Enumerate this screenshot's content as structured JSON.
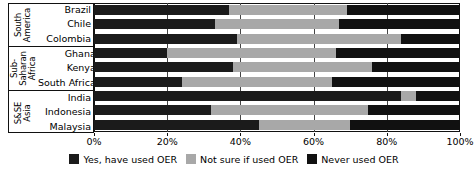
{
  "chart_data": {
    "type": "bar",
    "orientation": "horizontal",
    "stacked": true,
    "normalized_percent": true,
    "title": "",
    "xlabel": "",
    "ylabel": "",
    "xlim": [
      0,
      100
    ],
    "grid": true,
    "legend_position": "bottom",
    "xticks": [
      {
        "value": 0,
        "label": "0%"
      },
      {
        "value": 20,
        "label": "20%"
      },
      {
        "value": 40,
        "label": "40%"
      },
      {
        "value": 60,
        "label": "60%"
      },
      {
        "value": 80,
        "label": "80%"
      },
      {
        "value": 100,
        "label": "100%"
      }
    ],
    "series": [
      {
        "name": "Yes, have used OER",
        "color": "#1b1b1b",
        "key": "yes"
      },
      {
        "name": "Not sure if used OER",
        "color": "#a8a8a8",
        "key": "not_sure"
      },
      {
        "name": "Never used OER",
        "color": "#111111",
        "key": "never"
      }
    ],
    "groups": [
      {
        "name": "South America",
        "title_lines": [
          "South",
          "America"
        ],
        "categories": [
          {
            "label": "Brazil",
            "values": [
              37,
              32,
              31
            ]
          },
          {
            "label": "Chile",
            "values": [
              33,
              34,
              33
            ]
          },
          {
            "label": "Colombia",
            "values": [
              39,
              45,
              16
            ]
          }
        ]
      },
      {
        "name": "Sub-Saharan Africa",
        "title_lines": [
          "Sub-",
          "Saharan",
          "Africa"
        ],
        "categories": [
          {
            "label": "Ghana",
            "values": [
              20,
              46,
              34
            ]
          },
          {
            "label": "Kenya",
            "values": [
              38,
              38,
              24
            ]
          },
          {
            "label": "South Africa",
            "values": [
              24,
              41,
              35
            ]
          }
        ]
      },
      {
        "name": "S&SE Asia",
        "title_lines": [
          "S&SE",
          "Asia"
        ],
        "categories": [
          {
            "label": "India",
            "values": [
              84,
              4,
              12
            ]
          },
          {
            "label": "Indonesia",
            "values": [
              32,
              43,
              25
            ]
          },
          {
            "label": "Malaysia",
            "values": [
              45,
              25,
              30
            ]
          }
        ]
      }
    ]
  }
}
